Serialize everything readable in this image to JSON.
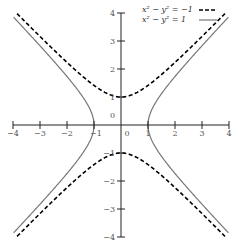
{
  "chart_data": {
    "type": "line",
    "title": "",
    "xlabel": "",
    "ylabel": "",
    "xlim": [
      -4,
      4
    ],
    "ylim": [
      -4,
      4
    ],
    "grid": false,
    "legend_position": "top-right",
    "x_ticks": [
      -4,
      -3,
      -2,
      -1,
      0,
      1,
      2,
      3,
      4
    ],
    "y_ticks": [
      -4,
      -3,
      -2,
      -1,
      0,
      1,
      2,
      3,
      4
    ],
    "x_tick_labels": [
      "−4",
      "−3",
      "−2",
      "−1",
      "0",
      "1",
      "2",
      "3",
      "4"
    ],
    "y_tick_labels": [
      "−4",
      "−3",
      "−2",
      "−1",
      "0",
      "1",
      "2",
      "3",
      "4"
    ],
    "series": [
      {
        "name": "x² − y² = −1",
        "equation": "x^2 - y^2 = -1",
        "style": "dashed",
        "color": "#000000"
      },
      {
        "name": "x² − y² = 1",
        "equation": "x^2 - y^2 = 1",
        "style": "solid",
        "color": "#777777"
      }
    ]
  }
}
